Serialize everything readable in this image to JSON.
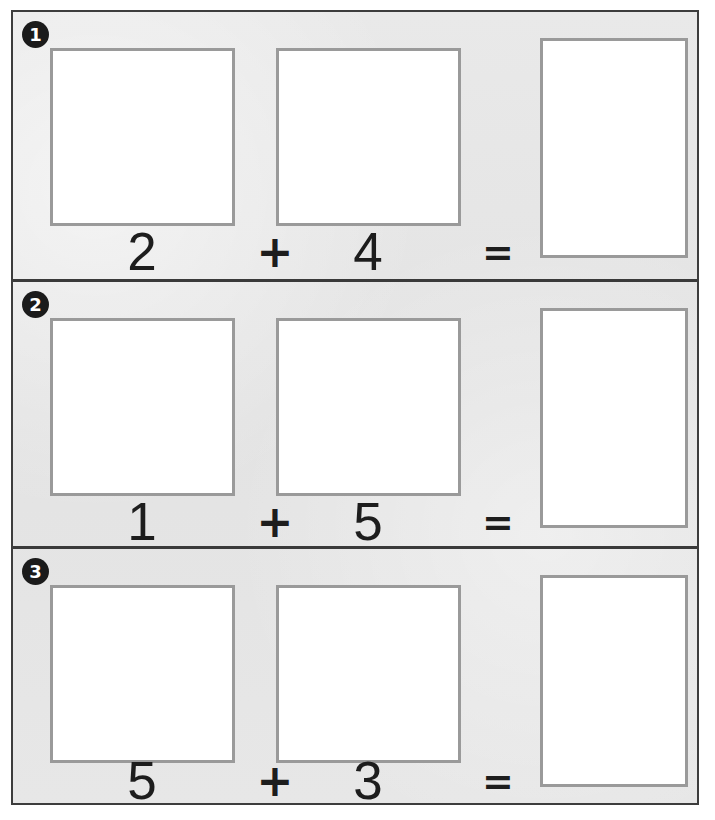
{
  "worksheet": {
    "title": "Addition practice worksheet",
    "background_color": "#e6e6e6",
    "frame_color": "#3d3d3d",
    "box_border_color": "#9a9a9a",
    "box_fill_color": "#ffffff",
    "badge_color": "#1b1b1b",
    "ink_color": "#1d1d1d",
    "operator_symbol": "+",
    "equals_symbol": "=",
    "rows": [
      {
        "badge": "1",
        "addend_a": "2",
        "addend_b": "4",
        "operator": "+",
        "equals": "=",
        "answer": ""
      },
      {
        "badge": "2",
        "addend_a": "1",
        "addend_b": "5",
        "operator": "+",
        "equals": "=",
        "answer": ""
      },
      {
        "badge": "3",
        "addend_a": "5",
        "addend_b": "3",
        "operator": "+",
        "equals": "=",
        "answer": ""
      }
    ]
  }
}
